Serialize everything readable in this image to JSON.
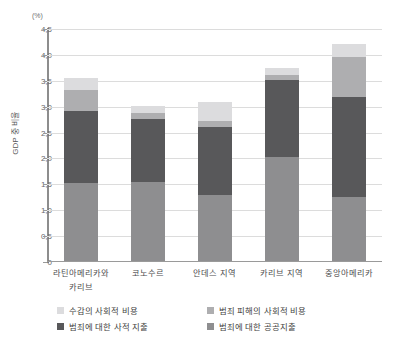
{
  "chart_data": {
    "type": "bar",
    "subtype": "stacked-column",
    "title": "",
    "unit_note": "(%)",
    "xlabel": "",
    "ylabel": "GDP 중 비율",
    "ylim": [
      0,
      4.5
    ],
    "ytick_labels": [
      "0",
      "0,5",
      "1,0",
      "1,5",
      "2,0",
      "2,5",
      "3,0",
      "3,5",
      "4,0",
      "4,5"
    ],
    "ytick_values": [
      0,
      0.5,
      1.0,
      1.5,
      2.0,
      2.5,
      3.0,
      3.5,
      4.0,
      4.5
    ],
    "grid": true,
    "legend_position": "bottom",
    "categories": [
      "라틴아메리카와 카리브",
      "코노수르",
      "안데스 지역",
      "카리브 지역",
      "중앙아메리카"
    ],
    "category_lines": [
      [
        "라틴아메리카와",
        "카리브"
      ],
      [
        "코노수르",
        ""
      ],
      [
        "안데스 지역",
        ""
      ],
      [
        "카리브 지역",
        ""
      ],
      [
        "중앙아메리카",
        ""
      ]
    ],
    "series": [
      {
        "name": "범죄에 대한 공공지출",
        "color": "#8e8e90",
        "values": [
          1.5,
          1.53,
          1.27,
          2.0,
          1.23
        ]
      },
      {
        "name": "범죄에 대한 사적 지출",
        "color": "#58585a",
        "values": [
          1.4,
          1.22,
          1.31,
          1.5,
          1.94
        ]
      },
      {
        "name": "범죄 피해의 사회적 비용",
        "color": "#aeaeb0",
        "values": [
          0.4,
          0.11,
          0.12,
          0.1,
          0.78
        ]
      },
      {
        "name": "수감의 사회적 비용",
        "color": "#dcdcde",
        "values": [
          0.23,
          0.14,
          0.38,
          0.12,
          0.25
        ]
      }
    ],
    "totals": [
      3.53,
      3.0,
      3.08,
      3.72,
      4.2
    ]
  },
  "legend": {
    "items": [
      {
        "label": "수감의 사회적 비용",
        "color": "#dcdcde"
      },
      {
        "label": "범죄 피해의 사회적 비용",
        "color": "#aeaeb0"
      },
      {
        "label": "범죄에 대한 사적 지출",
        "color": "#58585a"
      },
      {
        "label": "범죄에 대한 공공지출",
        "color": "#8e8e90"
      }
    ]
  },
  "colors": {
    "gridline": "#dcdcdc",
    "axis": "#8d8d8d",
    "text": "#4c4c4e",
    "background": "#ffffff"
  }
}
